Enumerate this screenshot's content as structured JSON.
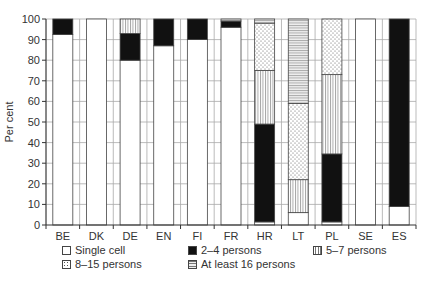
{
  "chart_data": {
    "type": "bar",
    "stacked": true,
    "title": "",
    "xlabel": "",
    "ylabel": "Per cent",
    "ylim": [
      0,
      100
    ],
    "yticks": [
      0,
      10,
      20,
      30,
      40,
      50,
      60,
      70,
      80,
      90,
      100
    ],
    "grid": true,
    "legend_position": "bottom",
    "categories": [
      "BE",
      "DK",
      "DE",
      "EN",
      "FI",
      "FR",
      "HR",
      "LT",
      "PL",
      "SE",
      "ES"
    ],
    "series": [
      {
        "name": "Single cell",
        "pattern": "white",
        "values": [
          92.5,
          100,
          80,
          87,
          90,
          96,
          1.5,
          6,
          1.5,
          100,
          9
        ]
      },
      {
        "name": "2–4 persons",
        "pattern": "black",
        "values": [
          7.5,
          0,
          13,
          13,
          10,
          3,
          47.5,
          0,
          33,
          0,
          91
        ]
      },
      {
        "name": "5–7 persons",
        "pattern": "vertical",
        "values": [
          0,
          0,
          7,
          0,
          0,
          0,
          26,
          16,
          38.5,
          0,
          0
        ]
      },
      {
        "name": "8–15 persons",
        "pattern": "dots",
        "values": [
          0,
          0,
          0,
          0,
          0,
          0,
          23,
          37,
          27,
          0,
          0
        ]
      },
      {
        "name": "At least 16 persons",
        "pattern": "horizontal",
        "values": [
          0,
          0,
          0,
          0,
          0,
          1,
          2,
          41,
          0,
          0,
          0
        ]
      }
    ]
  },
  "legend": [
    {
      "label": "Single cell"
    },
    {
      "label": "2–4 persons"
    },
    {
      "label": "5–7 persons"
    },
    {
      "label": "8–15 persons"
    },
    {
      "label": "At least 16 persons"
    }
  ]
}
